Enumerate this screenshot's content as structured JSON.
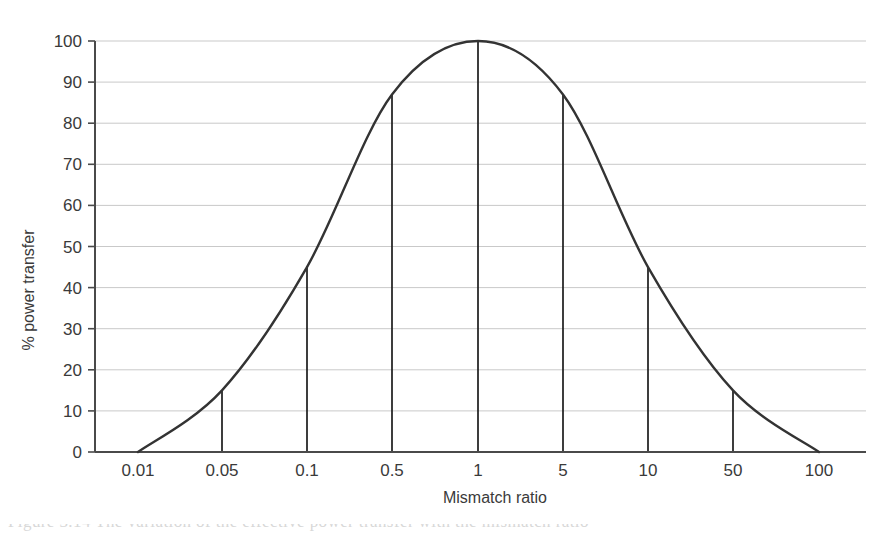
{
  "chart_data": {
    "type": "line",
    "title": "",
    "xlabel": "Mismatch ratio",
    "ylabel": "% power transfer",
    "x_scale": "log",
    "x_tick_labels": [
      "0.01",
      "0.05",
      "0.1",
      "0.5",
      "1",
      "5",
      "10",
      "50",
      "100"
    ],
    "x_tick_values": [
      0.01,
      0.05,
      0.1,
      0.5,
      1,
      5,
      10,
      50,
      100
    ],
    "y_tick_labels": [
      "0",
      "10",
      "20",
      "30",
      "40",
      "50",
      "60",
      "70",
      "80",
      "90",
      "100"
    ],
    "y_tick_values": [
      0,
      10,
      20,
      30,
      40,
      50,
      60,
      70,
      80,
      90,
      100
    ],
    "ylim": [
      0,
      100
    ],
    "grid": true,
    "legend": "none",
    "series": [
      {
        "name": "% power transfer",
        "points": [
          {
            "x": 0.01,
            "y": 0
          },
          {
            "x": 0.05,
            "y": 15
          },
          {
            "x": 0.1,
            "y": 45
          },
          {
            "x": 0.5,
            "y": 87
          },
          {
            "x": 1,
            "y": 100
          },
          {
            "x": 5,
            "y": 87
          },
          {
            "x": 10,
            "y": 45
          },
          {
            "x": 50,
            "y": 15
          },
          {
            "x": 100,
            "y": 0
          }
        ],
        "color": "#333333",
        "line_width": 2.4
      }
    ],
    "drop_lines": [
      {
        "x": 0.05,
        "y": 15
      },
      {
        "x": 0.1,
        "y": 45
      },
      {
        "x": 0.5,
        "y": 87
      },
      {
        "x": 1,
        "y": 100
      },
      {
        "x": 5,
        "y": 87
      },
      {
        "x": 10,
        "y": 45
      },
      {
        "x": 50,
        "y": 15
      }
    ],
    "drop_line_color": "#1c1c1c",
    "grid_color": "#c9c9c9",
    "axis_color": "#4a4a4a",
    "background": "#ffffff"
  },
  "caption": {
    "partial_text": "Figure 3.14 The variation of the effective power transfer with the mismatch ratio"
  }
}
